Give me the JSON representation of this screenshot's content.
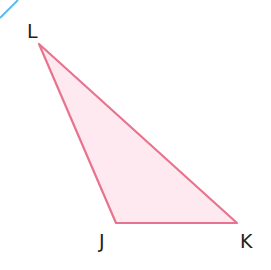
{
  "diagram": {
    "type": "triangle",
    "vertices": [
      {
        "name": "L",
        "x": 39,
        "y": 44,
        "label_x": 34,
        "label_y": 38
      },
      {
        "name": "J",
        "x": 116,
        "y": 223,
        "label_x": 106,
        "label_y": 247
      },
      {
        "name": "K",
        "x": 237,
        "y": 223,
        "label_x": 242,
        "label_y": 247
      }
    ],
    "colors": {
      "stroke": "#e8738e",
      "fill": "#fde9ef",
      "corner_line": "#5bbde6"
    }
  }
}
